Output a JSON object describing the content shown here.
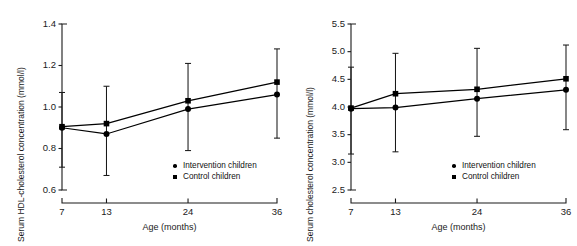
{
  "figure": {
    "panels": [
      {
        "name": "hdl-cholesterol-panel",
        "ylabel": "Serum HDL-cholesterol concentration (mmol/l)",
        "xlabel": "Age (months)",
        "yticks": [
          "1.4",
          "1.2",
          "1.0",
          "0.8",
          "0.6"
        ],
        "xticks": [
          "7",
          "13",
          "24",
          "36"
        ],
        "legend": [
          {
            "label": "Intervention children",
            "marker": "circle"
          },
          {
            "label": "Control children",
            "marker": "square"
          }
        ]
      },
      {
        "name": "total-cholesterol-panel",
        "ylabel": "Serum cholesterol concentration (mmol/l)",
        "xlabel": "Age (months)",
        "yticks": [
          "5.5",
          "5.0",
          "4.5",
          "4.0",
          "3.5",
          "3.0",
          "2.5"
        ],
        "xticks": [
          "7",
          "13",
          "24",
          "36"
        ],
        "legend": [
          {
            "label": "Intervention children",
            "marker": "circle"
          },
          {
            "label": "Control children",
            "marker": "square"
          }
        ]
      }
    ]
  },
  "chart_data": [
    {
      "type": "line",
      "title": "",
      "xlabel": "Age (months)",
      "ylabel": "Serum HDL-cholesterol concentration (mmol/l)",
      "x": [
        7,
        13,
        24,
        36
      ],
      "xtick_labels": [
        "7",
        "13",
        "24",
        "36"
      ],
      "ylim": [
        0.6,
        1.4
      ],
      "ytick_values": [
        0.6,
        0.8,
        1.0,
        1.2,
        1.4
      ],
      "ytick_labels": [
        "0.6",
        "0.8",
        "1.0",
        "1.2",
        "1.4"
      ],
      "grid": false,
      "legend_position": "inside lower right",
      "error_bars": "vertical, capped (SD)",
      "series": [
        {
          "name": "Intervention children",
          "marker": "circle",
          "values": [
            0.9,
            0.87,
            0.99,
            1.06
          ],
          "err_low": [
            0.71,
            0.67,
            0.79,
            0.85
          ],
          "err_high": [
            1.07,
            1.1,
            1.21,
            1.28
          ]
        },
        {
          "name": "Control children",
          "marker": "square",
          "values": [
            0.905,
            0.92,
            1.03,
            1.12
          ],
          "err_low": [
            0.71,
            0.67,
            0.79,
            0.85
          ],
          "err_high": [
            1.07,
            1.1,
            1.21,
            1.28
          ]
        }
      ]
    },
    {
      "type": "line",
      "title": "",
      "xlabel": "Age (months)",
      "ylabel": "Serum cholesterol concentration (mmol/l)",
      "x": [
        7,
        13,
        24,
        36
      ],
      "xtick_labels": [
        "7",
        "13",
        "24",
        "36"
      ],
      "ylim": [
        2.5,
        5.5
      ],
      "ytick_values": [
        2.5,
        3.0,
        3.5,
        4.0,
        4.5,
        5.0,
        5.5
      ],
      "ytick_labels": [
        "2.5",
        "3.0",
        "3.5",
        "4.0",
        "4.5",
        "5.0",
        "5.5"
      ],
      "grid": false,
      "legend_position": "inside lower right",
      "error_bars": "vertical, capped (SD)",
      "series": [
        {
          "name": "Intervention children",
          "marker": "circle",
          "values": [
            3.97,
            3.99,
            4.15,
            4.31
          ],
          "err_low": [
            3.15,
            3.19,
            3.47,
            3.59
          ],
          "err_high": [
            4.72,
            4.97,
            5.06,
            5.12
          ]
        },
        {
          "name": "Control children",
          "marker": "square",
          "values": [
            3.98,
            4.24,
            4.32,
            4.51
          ],
          "err_low": [
            3.15,
            3.19,
            3.47,
            3.59
          ],
          "err_high": [
            4.72,
            4.97,
            5.06,
            5.12
          ]
        }
      ]
    }
  ]
}
